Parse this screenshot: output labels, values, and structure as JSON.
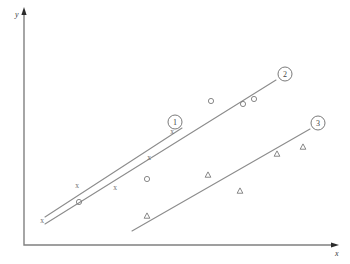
{
  "figure": {
    "width": 350,
    "height": 264,
    "background": "#ffffff",
    "line_color": "#8c8c8c",
    "marker_color": "#7a7a7a",
    "axis_color": "#808080"
  },
  "axes": {
    "x_label": "x",
    "y_label": "y",
    "origin": [
      24,
      245
    ],
    "x_end": [
      334,
      245
    ],
    "y_top": [
      24,
      12
    ],
    "ticks": [],
    "gridlines": false
  },
  "callouts": [
    {
      "label": "1",
      "cx": 175,
      "cy": 122,
      "r": 7
    },
    {
      "label": "2",
      "cx": 285,
      "cy": 74,
      "r": 7
    },
    {
      "label": "3",
      "cx": 318,
      "cy": 123,
      "r": 7
    }
  ],
  "chart_data": {
    "type": "scatter",
    "title": "",
    "xlabel": "x",
    "ylabel": "y",
    "xlim": [
      24,
      334
    ],
    "ylim": [
      12,
      245
    ],
    "grid": false,
    "legend_position": "inline-callouts",
    "series": [
      {
        "name": "1",
        "marker": "x",
        "callout": "1",
        "points": [
          [
            42,
            221
          ],
          [
            77,
            186
          ],
          [
            115,
            188
          ],
          [
            149,
            158
          ],
          [
            172,
            132
          ]
        ],
        "fit_line": {
          "x1": 45,
          "y1": 217,
          "x2": 182,
          "y2": 128
        }
      },
      {
        "name": "2",
        "marker": "o",
        "callout": "2",
        "points": [
          [
            79,
            202
          ],
          [
            147,
            179
          ],
          [
            211,
            101
          ],
          [
            243,
            104
          ],
          [
            254,
            99
          ]
        ],
        "fit_line": {
          "x1": 45,
          "y1": 224,
          "x2": 276,
          "y2": 80
        }
      },
      {
        "name": "3",
        "marker": "triangle",
        "callout": "3",
        "points": [
          [
            147,
            216
          ],
          [
            208,
            175
          ],
          [
            240,
            191
          ],
          [
            277,
            154
          ],
          [
            303,
            147
          ]
        ],
        "fit_line": {
          "x1": 132,
          "y1": 231,
          "x2": 310,
          "y2": 129
        }
      }
    ]
  }
}
